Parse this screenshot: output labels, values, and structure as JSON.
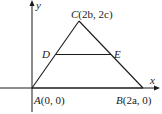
{
  "diagram": {
    "axes": {
      "x_label": "x",
      "y_label": "y"
    },
    "points": {
      "A": {
        "name": "A",
        "coords": "(0, 0)"
      },
      "B": {
        "name": "B",
        "coords": "(2a, 0)"
      },
      "C": {
        "name": "C",
        "coords": "(2b, 2c)"
      },
      "D": {
        "name": "D"
      },
      "E": {
        "name": "E"
      }
    },
    "segments": [
      "AB",
      "BC",
      "CA",
      "DE"
    ],
    "colors": {
      "stroke": "#1a1a1a",
      "background": "#ffffff"
    }
  }
}
